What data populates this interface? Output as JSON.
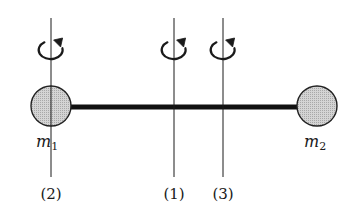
{
  "diagram": {
    "type": "dumbbell-rotation-axes",
    "colors": {
      "line": "#1a1a1a",
      "rod": "#111111",
      "mass_fill": "#c8c8c8",
      "mass_stroke": "#222222",
      "background": "#ffffff"
    },
    "rod": {
      "x1": 70,
      "x2": 298,
      "y": 107,
      "thickness": 5
    },
    "masses": [
      {
        "id": "m1",
        "symbol": "m",
        "subscript": "1",
        "cx": 51,
        "cy": 106,
        "r": 20,
        "label_x": 36,
        "label_y": 147
      },
      {
        "id": "m2",
        "symbol": "m",
        "subscript": "2",
        "cx": 317,
        "cy": 106,
        "r": 20,
        "label_x": 304,
        "label_y": 147
      }
    ],
    "axes": [
      {
        "id": "axis-2",
        "label": "(2)",
        "x": 51,
        "y1": 18,
        "y2": 177,
        "label_y": 199
      },
      {
        "id": "axis-1",
        "label": "(1)",
        "x": 174,
        "y1": 18,
        "y2": 177,
        "label_y": 199
      },
      {
        "id": "axis-3",
        "label": "(3)",
        "x": 223,
        "y1": 18,
        "y2": 177,
        "label_y": 199
      }
    ],
    "rotation_arrows": [
      {
        "axis": "axis-2",
        "cx": 51,
        "cy": 50,
        "direction": "counterclockwise-viewed-from-top"
      },
      {
        "axis": "axis-1",
        "cx": 174,
        "cy": 50,
        "direction": "counterclockwise-viewed-from-top"
      },
      {
        "axis": "axis-3",
        "cx": 223,
        "cy": 50,
        "direction": "counterclockwise-viewed-from-top"
      }
    ]
  }
}
